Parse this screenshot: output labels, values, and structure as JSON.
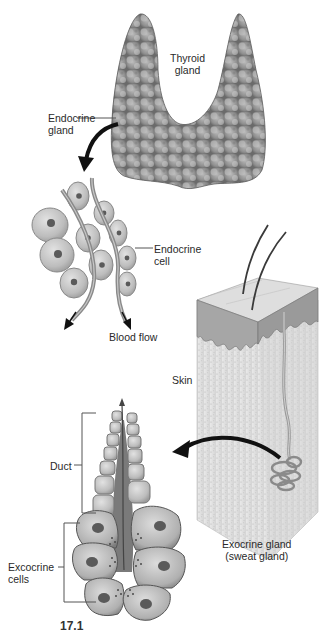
{
  "diagram": {
    "labels": {
      "thyroid_gland": [
        "Thyroid",
        "gland"
      ],
      "endocrine_gland": [
        "Endocrine",
        "gland"
      ],
      "endocrine_cell": [
        "Endocrine",
        "cell"
      ],
      "blood_flow": "Blood flow",
      "skin": "Skin",
      "duct": "Duct",
      "exocrine_cells": [
        "Excocrine",
        "cells"
      ],
      "exocrine_gland": [
        "Exocrine gland",
        "(sweat gland)"
      ],
      "figure_number_cropped": "17.1"
    },
    "colors": {
      "thyroid_fill": "#8c8c8c",
      "thyroid_highlight": "#c8c8c8",
      "cell_fill": "#bdbdbd",
      "cell_edge": "#7a7a7a",
      "nucleus": "#5a5a5a",
      "vessel": "#8a8a8a",
      "arrow": "#111111",
      "skin_top": "#d9d9d9",
      "skin_epidermis": "#a8a8a8",
      "dermis": "#e6e6e6",
      "leader_line": "#555555"
    }
  }
}
